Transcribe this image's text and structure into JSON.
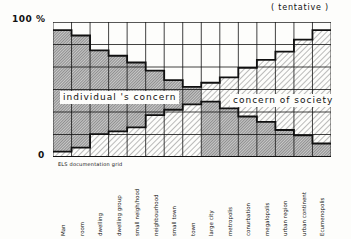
{
  "annotations": {
    "y_top": "100 %",
    "y_bottom": "0",
    "tentative": "( tentative )",
    "subtitle": "ELS documentation grid",
    "individual_label": "individual 's concern",
    "society_label": "concern of society"
  },
  "colors": {
    "ink": "#111111",
    "paper": "#fdfdfb",
    "individual_hatch": "#555555",
    "society_hatch": "#777777"
  },
  "chart_data": {
    "type": "area",
    "title": "",
    "xlabel": "",
    "ylabel": "%",
    "ylim": [
      0,
      100
    ],
    "grid": true,
    "legend_position": "inline",
    "categories": [
      "Man",
      "room",
      "dwelling",
      "dwelling group",
      "small neigh/hood",
      "neighbourhood",
      "small town",
      "town",
      "large city",
      "metropolis",
      "conurbation",
      "megalopolis",
      "urban region",
      "urban continent",
      "Ecumenopolis"
    ],
    "total_filled": [
      94,
      90,
      79,
      75,
      70,
      64,
      57,
      52,
      55,
      59,
      66,
      72,
      78,
      87,
      94
    ],
    "divider": [
      4,
      7,
      17,
      19,
      22,
      31,
      35,
      39,
      41,
      36,
      30,
      26,
      20,
      16,
      10
    ],
    "series": [
      {
        "name": "individual's concern",
        "values": [
          90,
          83,
          62,
          56,
          48,
          33,
          22,
          13,
          41,
          36,
          30,
          26,
          20,
          16,
          10
        ]
      },
      {
        "name": "concern of society",
        "values": [
          4,
          7,
          17,
          19,
          22,
          31,
          35,
          39,
          14,
          23,
          36,
          46,
          58,
          71,
          84
        ]
      }
    ],
    "layering": "columns 1-8: society at bottom, individual on top; columns 9-15: individual at bottom, society on top",
    "annotations": [
      "( tentative )",
      "ELS documentation grid"
    ]
  }
}
